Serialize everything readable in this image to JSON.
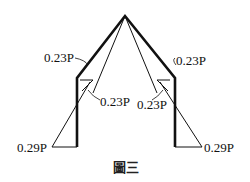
{
  "diagram": {
    "labels": {
      "rafter_left_eave": "0.23P",
      "rafter_right_eave": "0.23P",
      "column_left_top": "0.23P",
      "column_right_top": "0.23P",
      "column_left_base": "0.29P",
      "column_right_base": "0.29P"
    },
    "caption": "圖三"
  }
}
